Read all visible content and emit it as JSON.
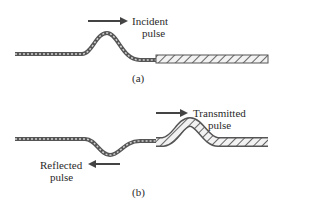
{
  "panel_a": {
    "label": "(a)",
    "pulse_label_line1": "Incident",
    "pulse_label_line2": "pulse",
    "arrow_direction": "right"
  },
  "panel_b": {
    "label": "(b)",
    "transmitted_line1": "Transmitted",
    "transmitted_line2": "pulse",
    "transmitted_arrow_direction": "right",
    "reflected_line1": "Reflected",
    "reflected_line2": "pulse",
    "reflected_arrow_direction": "left"
  },
  "colors": {
    "rope": "#555555",
    "ink": "#2a2a2a",
    "background": "#ffffff"
  }
}
